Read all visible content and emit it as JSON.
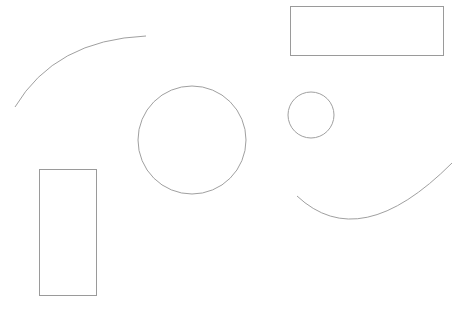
{
  "canvas": {
    "width": 472,
    "height": 314,
    "background": "#ffffff"
  },
  "style": {
    "stroke_color": "#a0a0a0",
    "rect_stroke_color": "#9a9a9a"
  },
  "shapes": [
    {
      "type": "arc",
      "name": "top-left-arc",
      "path": "M 15 107 Q 55 40 146 36"
    },
    {
      "type": "rect",
      "name": "top-right-rectangle",
      "x": 290,
      "y": 6,
      "width": 153,
      "height": 49
    },
    {
      "type": "circle",
      "name": "large-circle",
      "cx": 192,
      "cy": 140,
      "r": 54
    },
    {
      "type": "circle",
      "name": "small-circle",
      "cx": 311,
      "cy": 115,
      "r": 23
    },
    {
      "type": "arc",
      "name": "bottom-right-arc",
      "path": "M 297 196 Q 360 255 452 163"
    },
    {
      "type": "rect",
      "name": "bottom-left-rectangle",
      "x": 39,
      "y": 169,
      "width": 57,
      "height": 126
    }
  ]
}
